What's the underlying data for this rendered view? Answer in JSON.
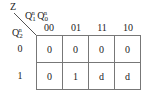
{
  "kmap": {
    "output_label": "Z",
    "col_vars": {
      "q1": "Q",
      "q1_sub": "1",
      "q1_sup": "n",
      "q0": "Q",
      "q0_sub": "0",
      "q0_sup": "n"
    },
    "row_var": {
      "q": "Q",
      "sub": "2",
      "sup": "n"
    },
    "col_headers": [
      "00",
      "01",
      "11",
      "10"
    ],
    "row_headers": [
      "0",
      "1"
    ],
    "cells": [
      [
        "0",
        "0",
        "0",
        "0"
      ],
      [
        "0",
        "1",
        "d",
        "d"
      ]
    ]
  }
}
